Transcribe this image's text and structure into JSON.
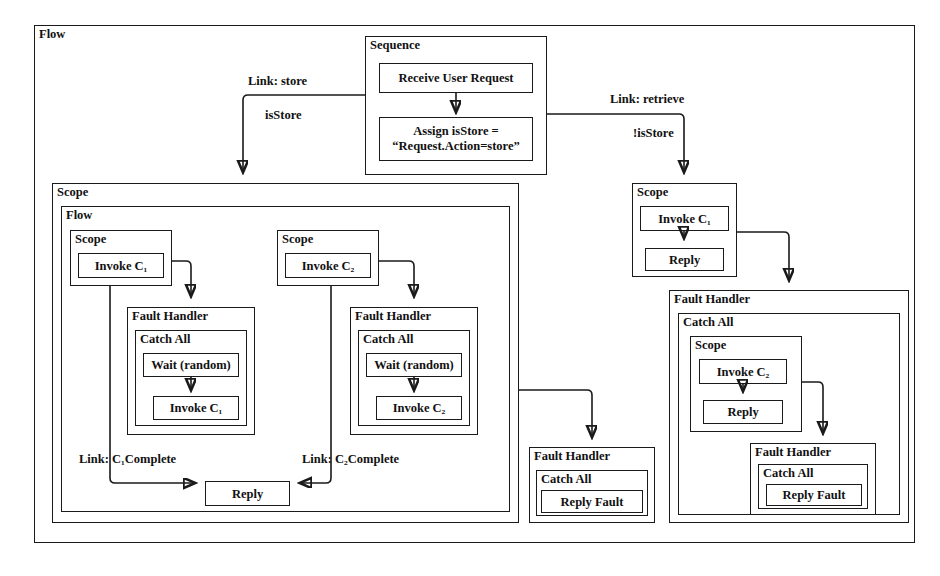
{
  "diagram": {
    "title_node": "Flow",
    "notation": "BPEL process diagram",
    "outer": {
      "label": "Flow"
    },
    "sequence": {
      "label": "Sequence",
      "activities": [
        {
          "label": "Receive User Request"
        },
        {
          "label": "Assign isStore = “Request.Action=store”",
          "line1": "Assign isStore =",
          "line2": "“Request.Action=store”"
        }
      ]
    },
    "links": {
      "store": {
        "name": "Link: store",
        "condition": "isStore"
      },
      "retrieve": {
        "name": "Link: retrieve",
        "condition": "!isStore"
      },
      "c1complete": {
        "name": "Link: C₁Complete"
      },
      "c2complete": {
        "name": "Link: C₂Complete"
      }
    },
    "store_branch": {
      "scope_label": "Scope",
      "flow_label": "Flow",
      "branch_c1": {
        "scope_label": "Scope",
        "invoke": "Invoke C₁",
        "fault_handler": {
          "label": "Fault Handler",
          "catch_all": "Catch All",
          "activities": [
            "Wait (random)",
            "Invoke C₁"
          ]
        }
      },
      "branch_c2": {
        "scope_label": "Scope",
        "invoke": "Invoke C₂",
        "fault_handler": {
          "label": "Fault Handler",
          "catch_all": "Catch All",
          "activities": [
            "Wait (random)",
            "Invoke C₂"
          ]
        }
      },
      "reply": "Reply",
      "scope_fault_handler": {
        "label": "Fault Handler",
        "catch_all": "Catch All",
        "activity": "Reply Fault"
      }
    },
    "retrieve_branch": {
      "scope_label": "Scope",
      "activities": [
        "Invoke C₁",
        "Reply"
      ],
      "fault_handler": {
        "label": "Fault Handler",
        "catch_all": "Catch All",
        "scope_label": "Scope",
        "scope_activities": [
          "Invoke C₂",
          "Reply"
        ],
        "inner_fault_handler": {
          "label": "Fault Handler",
          "catch_all": "Catch All",
          "activity": "Reply Fault"
        }
      }
    }
  },
  "colors": {
    "stroke": "#1a1a1a",
    "background": "#ffffff",
    "text": "#111111"
  }
}
